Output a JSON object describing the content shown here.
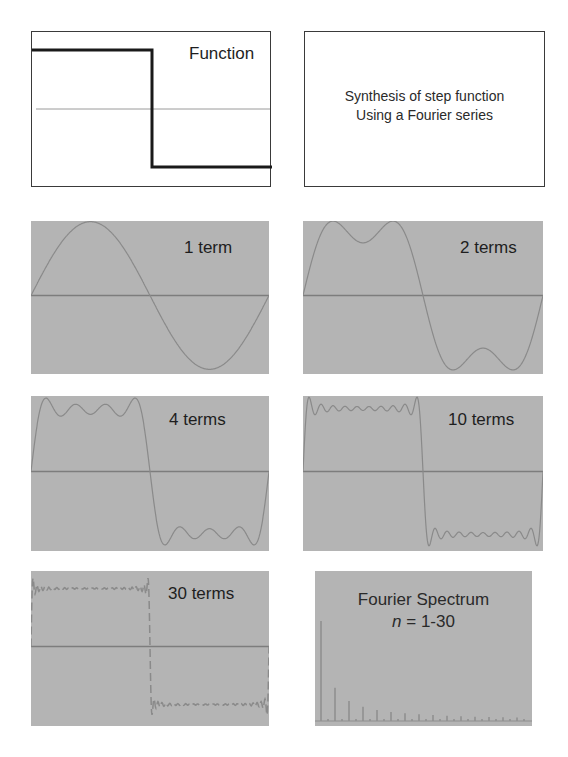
{
  "figure": {
    "panels": [
      {
        "id": "function",
        "label": "Function",
        "background": "#ffffff"
      },
      {
        "id": "caption",
        "lines": [
          "Synthesis of step function",
          "Using a Fourier series"
        ],
        "background": "#ffffff"
      },
      {
        "id": "1term",
        "label": "1 term",
        "terms": 1,
        "background": "#b4b4b4"
      },
      {
        "id": "2terms",
        "label": "2 terms",
        "terms": 2,
        "background": "#b4b4b4"
      },
      {
        "id": "4terms",
        "label": "4 terms",
        "terms": 4,
        "background": "#b4b4b4"
      },
      {
        "id": "10terms",
        "label": "10 terms",
        "terms": 10,
        "background": "#b4b4b4"
      },
      {
        "id": "30terms",
        "label": "30 terms",
        "terms": 30,
        "background": "#b4b4b4"
      },
      {
        "id": "spectrum",
        "title": "Fourier Spectrum",
        "n_prefix": "n",
        "n_range": "= 1-30",
        "background": "#b4b4b4"
      }
    ]
  },
  "chart_data": [
    {
      "type": "line",
      "title": "Function",
      "description": "Step (square) function: +1 on first half, -1 on second half",
      "x": [
        0,
        0.5,
        0.5,
        1
      ],
      "y": [
        1,
        1,
        -1,
        -1
      ]
    },
    {
      "type": "line",
      "title": "1 term",
      "terms": 1,
      "series": "sum of odd sine harmonics (4/π)Σ sin(nx)/n"
    },
    {
      "type": "line",
      "title": "2 terms",
      "terms": 2,
      "harmonics": [
        1,
        3
      ]
    },
    {
      "type": "line",
      "title": "4 terms",
      "terms": 4,
      "harmonics": [
        1,
        3,
        5,
        7
      ]
    },
    {
      "type": "line",
      "title": "10 terms",
      "terms": 10
    },
    {
      "type": "line",
      "title": "30 terms",
      "terms": 30
    },
    {
      "type": "bar",
      "title": "Fourier Spectrum n = 1-30",
      "categories": [
        1,
        2,
        3,
        4,
        5,
        6,
        7,
        8,
        9,
        10,
        11,
        12,
        13,
        14,
        15,
        16,
        17,
        18,
        19,
        20,
        21,
        22,
        23,
        24,
        25,
        26,
        27,
        28,
        29,
        30
      ],
      "values": [
        1,
        0,
        0.333,
        0,
        0.2,
        0,
        0.143,
        0,
        0.111,
        0,
        0.091,
        0,
        0.077,
        0,
        0.067,
        0,
        0.059,
        0,
        0.053,
        0,
        0.048,
        0,
        0.043,
        0,
        0.04,
        0,
        0.037,
        0,
        0.034,
        0
      ],
      "note": "amplitudes ∝ 1/n for odd n"
    }
  ]
}
